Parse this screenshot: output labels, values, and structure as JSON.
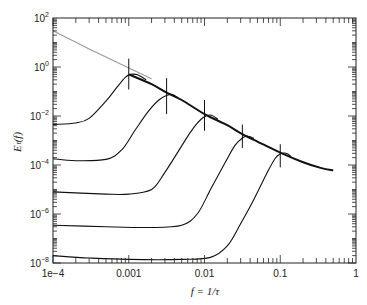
{
  "chart_data": {
    "type": "line",
    "title": "",
    "xlabel": "f = 1/τ",
    "ylabel": "Eₜ(f)",
    "xscale": "log",
    "yscale": "log",
    "xlim": [
      0.0001,
      1
    ],
    "ylim": [
      1e-08,
      100
    ],
    "grid": false,
    "legend": null,
    "x_ticks": [
      {
        "value": 0.0001,
        "label": "1e−4"
      },
      {
        "value": 0.001,
        "label": "0.001"
      },
      {
        "value": 0.01,
        "label": "0.01"
      },
      {
        "value": 0.1,
        "label": "0.1"
      },
      {
        "value": 1,
        "label": "1"
      }
    ],
    "y_ticks": [
      {
        "value": 100,
        "base": "10",
        "exp": "2"
      },
      {
        "value": 1,
        "base": "10",
        "exp": "0"
      },
      {
        "value": 0.01,
        "base": "10",
        "exp": "−2"
      },
      {
        "value": 0.0001,
        "base": "10",
        "exp": "−4"
      },
      {
        "value": 1e-06,
        "base": "10",
        "exp": "−6"
      },
      {
        "value": 1e-08,
        "base": "10",
        "exp": "−8"
      }
    ],
    "reference_line": {
      "name": "asymptotic envelope (gray)",
      "color": "#999999",
      "points": [
        [
          0.0001,
          30
        ],
        [
          0.0003,
          5.5
        ],
        [
          0.001,
          0.9
        ],
        [
          0.002,
          0.33
        ]
      ]
    },
    "envelope": {
      "name": "common envelope (bold)",
      "color": "#111111",
      "points": [
        [
          0.001,
          0.5
        ],
        [
          0.002,
          0.2
        ],
        [
          0.00316,
          0.09
        ],
        [
          0.005,
          0.045
        ],
        [
          0.01,
          0.012
        ],
        [
          0.02,
          0.0042
        ],
        [
          0.0316,
          0.0018
        ],
        [
          0.05,
          0.0009
        ],
        [
          0.1,
          0.00032
        ],
        [
          0.2,
          0.00013
        ],
        [
          0.35,
          7.5e-05
        ],
        [
          0.5,
          6e-05
        ]
      ]
    },
    "series": [
      {
        "name": "curve 1",
        "peak_f": 0.001,
        "error_bar": [
          0.12,
          2.2
        ],
        "points": [
          [
            0.0001,
            0.0045
          ],
          [
            0.0002,
            0.0052
          ],
          [
            0.0003,
            0.008
          ],
          [
            0.0005,
            0.04
          ],
          [
            0.0007,
            0.15
          ],
          [
            0.0009,
            0.38
          ],
          [
            0.00105,
            0.5
          ],
          [
            0.0013,
            0.48
          ],
          [
            0.0017,
            0.3
          ]
        ]
      },
      {
        "name": "curve 2",
        "peak_f": 0.00316,
        "error_bar": [
          0.012,
          0.35
        ],
        "points": [
          [
            0.0001,
            0.00018
          ],
          [
            0.0002,
            0.00015
          ],
          [
            0.0005,
            0.00017
          ],
          [
            0.0008,
            0.0004
          ],
          [
            0.0012,
            0.0025
          ],
          [
            0.0018,
            0.015
          ],
          [
            0.0025,
            0.045
          ],
          [
            0.0032,
            0.07
          ],
          [
            0.0038,
            0.075
          ],
          [
            0.0045,
            0.055
          ]
        ]
      },
      {
        "name": "curve 3",
        "peak_f": 0.01,
        "error_bar": [
          0.0025,
          0.045
        ],
        "points": [
          [
            0.0001,
            8e-06
          ],
          [
            0.0005,
            6.5e-06
          ],
          [
            0.001,
            6.5e-06
          ],
          [
            0.002,
            1e-05
          ],
          [
            0.003,
            5e-05
          ],
          [
            0.005,
            0.0006
          ],
          [
            0.007,
            0.003
          ],
          [
            0.0095,
            0.0085
          ],
          [
            0.012,
            0.011
          ],
          [
            0.015,
            0.0075
          ]
        ]
      },
      {
        "name": "curve 4",
        "peak_f": 0.0316,
        "error_bar": [
          0.0005,
          0.0045
        ],
        "points": [
          [
            0.0001,
            3.5e-07
          ],
          [
            0.0005,
            3e-07
          ],
          [
            0.002,
            2.8e-07
          ],
          [
            0.005,
            3.5e-07
          ],
          [
            0.008,
            1e-06
          ],
          [
            0.012,
            1e-05
          ],
          [
            0.018,
            0.0001
          ],
          [
            0.025,
            0.0006
          ],
          [
            0.032,
            0.0013
          ],
          [
            0.038,
            0.0015
          ],
          [
            0.045,
            0.0012
          ]
        ]
      },
      {
        "name": "curve 5",
        "peak_f": 0.1,
        "error_bar": [
          8e-05,
          0.0007
        ],
        "points": [
          [
            0.0001,
            2e-08
          ],
          [
            0.0003,
            1.6e-08
          ],
          [
            0.001,
            1.4e-08
          ],
          [
            0.005,
            1.4e-08
          ],
          [
            0.012,
            1.7e-08
          ],
          [
            0.02,
            5e-08
          ],
          [
            0.03,
            4e-07
          ],
          [
            0.045,
            4e-06
          ],
          [
            0.065,
            4e-05
          ],
          [
            0.085,
            0.00018
          ],
          [
            0.1,
            0.00028
          ],
          [
            0.12,
            0.0003
          ],
          [
            0.14,
            0.00022
          ]
        ]
      }
    ]
  }
}
